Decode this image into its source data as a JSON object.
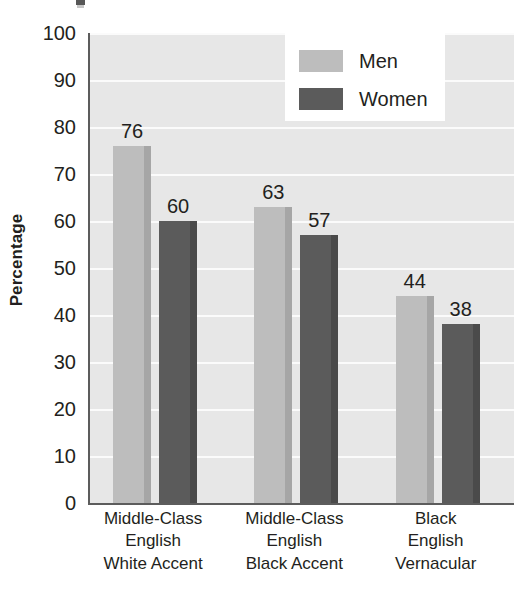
{
  "chart_data": {
    "type": "bar",
    "title": "",
    "xlabel": "",
    "ylabel": "Percentage",
    "ylim": [
      0,
      100
    ],
    "ytick_step": 10,
    "yticks": [
      100,
      90,
      80,
      70,
      60,
      50,
      40,
      30,
      20,
      10,
      0
    ],
    "grid": true,
    "legend_position": "top-right inside plot",
    "categories": [
      "Middle-Class English White Accent",
      "Middle-Class English Black Accent",
      "Black English Vernacular"
    ],
    "category_lines": [
      [
        "Middle-Class",
        "English",
        "White Accent"
      ],
      [
        "Middle-Class",
        "English",
        "Black Accent"
      ],
      [
        "Black",
        "English",
        "Vernacular"
      ]
    ],
    "series": [
      {
        "name": "Men",
        "color": "#bdbdbd",
        "values": [
          76,
          63,
          44
        ]
      },
      {
        "name": "Women",
        "color": "#5b5b5b",
        "values": [
          60,
          57,
          38
        ]
      }
    ]
  },
  "legend": {
    "items": [
      {
        "label": "Men",
        "swatch": "men"
      },
      {
        "label": "Women",
        "swatch": "women"
      }
    ]
  },
  "colors": {
    "plot_background": "#e7e7e7",
    "gridline": "#fbfbfb",
    "axis": "#5c5c5c",
    "men_bar": "#bdbdbd",
    "women_bar": "#5b5b5b",
    "text": "#231f20",
    "legend_background": "#ffffff"
  }
}
